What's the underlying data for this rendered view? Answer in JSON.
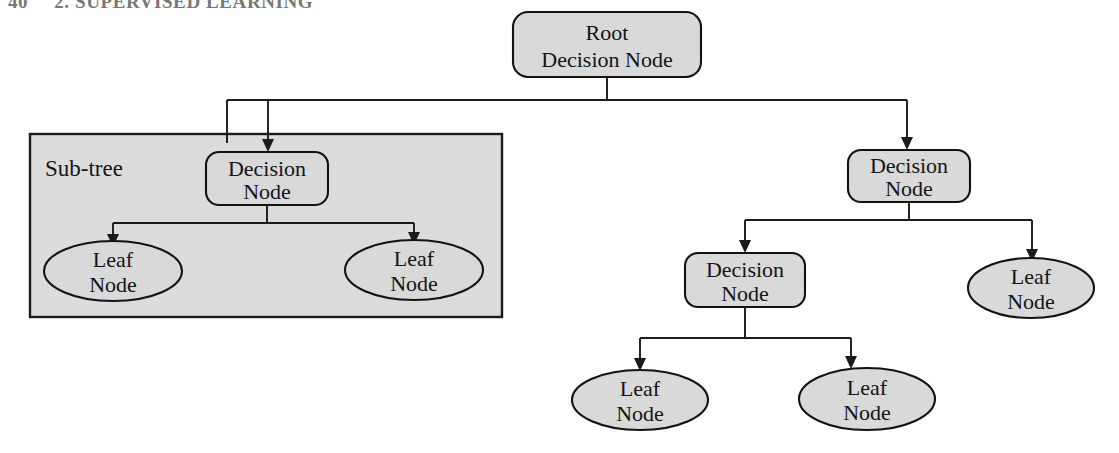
{
  "page": {
    "folio": "40",
    "running_head": "2. SUPERVISED LEARNING"
  },
  "figure": {
    "group_label": "Sub-tree",
    "colors": {
      "node_fill": "#d9d9d9",
      "group_fill": "#dcdcdc",
      "stroke": "#1b1b1b",
      "background": "#ffffff"
    },
    "nodes": {
      "root": {
        "line1": "Root",
        "line2": "Decision Node"
      },
      "subtree_decision": {
        "line1": "Decision",
        "line2": "Node"
      },
      "subtree_leaf_left": {
        "line1": "Leaf",
        "line2": "Node"
      },
      "subtree_leaf_right": {
        "line1": "Leaf",
        "line2": "Node"
      },
      "right_decision": {
        "line1": "Decision",
        "line2": "Node"
      },
      "right_child_decision": {
        "line1": "Decision",
        "line2": "Node"
      },
      "right_child_leaf": {
        "line1": "Leaf",
        "line2": "Node"
      },
      "bottom_leaf_left": {
        "line1": "Leaf",
        "line2": "Node"
      },
      "bottom_leaf_right": {
        "line1": "Leaf",
        "line2": "Node"
      }
    }
  }
}
